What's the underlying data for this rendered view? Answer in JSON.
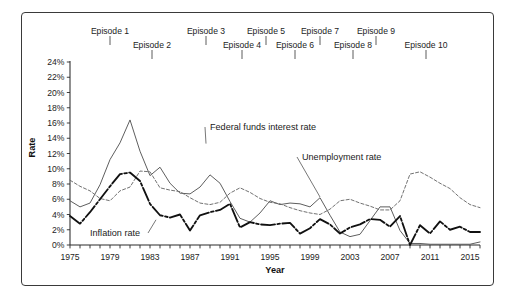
{
  "figure": {
    "border_color": "#3a3a3a",
    "background": "#ffffff"
  },
  "axes": {
    "x_title": "Year",
    "y_title": "Rate"
  },
  "episodes": {
    "label_prefix": "Episode",
    "items": [
      {
        "label": "Episode 1",
        "year": 1979.0,
        "row": 0
      },
      {
        "label": "Episode 2",
        "year": 1983.2,
        "row": 1
      },
      {
        "label": "Episode 3",
        "year": 1988.6,
        "row": 0
      },
      {
        "label": "Episode 4",
        "year": 1992.2,
        "row": 1
      },
      {
        "label": "Episode 5",
        "year": 1994.6,
        "row": 0
      },
      {
        "label": "Episode 6",
        "year": 1997.5,
        "row": 1
      },
      {
        "label": "Episode 7",
        "year": 2000.0,
        "row": 0
      },
      {
        "label": "Episode 8",
        "year": 2003.3,
        "row": 1
      },
      {
        "label": "Episode 9",
        "year": 2005.6,
        "row": 0
      },
      {
        "label": "Episode 10",
        "year": 2010.6,
        "row": 1
      }
    ]
  },
  "series_labels": [
    {
      "name": "federal-funds-label",
      "text": "Federal funds interest rate"
    },
    {
      "name": "unemployment-label",
      "text": "Unemployment rate"
    },
    {
      "name": "inflation-label",
      "text": "Inflation rate"
    }
  ],
  "chart_data": {
    "type": "line",
    "title": "",
    "xlabel": "Year",
    "ylabel": "Rate",
    "xlim": [
      1975,
      2016
    ],
    "ylim": [
      0,
      24
    ],
    "y_tick_step": 2,
    "y_tick_labels": [
      "0%",
      "2%",
      "4%",
      "6%",
      "8%",
      "10%",
      "12%",
      "14%",
      "16%",
      "18%",
      "20%",
      "22%",
      "24%"
    ],
    "x_tick_labels": [
      "1975",
      "1979",
      "1983",
      "1987",
      "1991",
      "1995",
      "1999",
      "2003",
      "2007",
      "2011",
      "2015"
    ],
    "x_tick_years": [
      1975,
      1979,
      1983,
      1987,
      1991,
      1995,
      1999,
      2003,
      2007,
      2011,
      2015
    ],
    "x_minor_tick_interval": 1,
    "grid": false,
    "legend": "inline-annotations",
    "x": [
      1975,
      1976,
      1977,
      1978,
      1979,
      1980,
      1981,
      1982,
      1983,
      1984,
      1985,
      1986,
      1987,
      1988,
      1989,
      1990,
      1991,
      1992,
      1993,
      1994,
      1995,
      1996,
      1997,
      1998,
      1999,
      2000,
      2001,
      2002,
      2003,
      2004,
      2005,
      2006,
      2007,
      2008,
      2009,
      2010,
      2011,
      2012,
      2013,
      2014,
      2015,
      2016
    ],
    "series": [
      {
        "name": "Federal funds interest rate",
        "style": "solid-thin",
        "color": "#555555",
        "values": [
          5.8,
          5.0,
          5.5,
          7.9,
          11.2,
          13.4,
          16.4,
          12.3,
          9.1,
          10.2,
          8.1,
          6.8,
          6.7,
          7.6,
          9.2,
          8.1,
          5.7,
          3.5,
          3.0,
          4.2,
          5.8,
          5.3,
          5.5,
          5.4,
          5.0,
          6.2,
          3.9,
          1.7,
          1.1,
          1.4,
          3.2,
          5.0,
          5.0,
          1.9,
          0.2,
          0.2,
          0.1,
          0.1,
          0.1,
          0.1,
          0.1,
          0.4
        ]
      },
      {
        "name": "Unemployment rate",
        "style": "dashed",
        "color": "#6a6a6a",
        "values": [
          8.5,
          7.7,
          7.1,
          6.1,
          5.8,
          7.1,
          7.6,
          9.7,
          9.6,
          7.5,
          7.2,
          7.0,
          6.2,
          5.5,
          5.3,
          5.6,
          6.8,
          7.5,
          6.9,
          6.1,
          5.6,
          5.4,
          4.9,
          4.5,
          4.2,
          4.0,
          4.7,
          5.8,
          6.0,
          5.5,
          5.1,
          4.6,
          4.6,
          5.8,
          9.3,
          9.6,
          8.9,
          8.1,
          7.4,
          6.2,
          5.3,
          4.9
        ]
      },
      {
        "name": "Inflation rate",
        "style": "thick-dash-dot",
        "color": "#111111",
        "values": [
          3.8,
          2.8,
          4.3,
          6.0,
          7.7,
          9.3,
          9.5,
          8.4,
          5.4,
          3.9,
          3.6,
          4.0,
          1.9,
          3.9,
          4.3,
          4.6,
          5.4,
          2.3,
          3.0,
          2.7,
          2.6,
          2.8,
          2.9,
          1.5,
          2.2,
          3.4,
          2.7,
          1.5,
          2.3,
          2.7,
          3.4,
          3.3,
          2.4,
          3.8,
          0.0,
          2.6,
          1.5,
          3.1,
          2.0,
          2.4,
          1.7,
          1.7
        ]
      }
    ],
    "annotations": [
      {
        "text": "Federal funds interest rate",
        "target_year": 1988.6,
        "target_value": 13.3
      },
      {
        "text": "Unemployment rate",
        "target_year": 2000.0,
        "target_value": 6.3
      },
      {
        "text": "Inflation rate",
        "target_year": 1983.6,
        "target_value": 3.3
      }
    ]
  }
}
